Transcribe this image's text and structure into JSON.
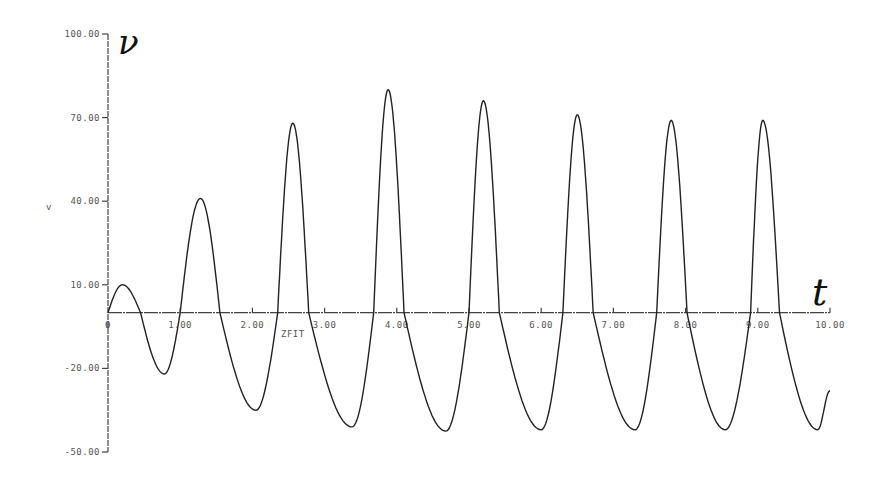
{
  "chart_data": {
    "type": "line",
    "title": "",
    "xlabel": "ZFIT",
    "ylabel": "v",
    "handwritten_y_label": "ν",
    "handwritten_x_label": "t",
    "xlim": [
      0,
      10
    ],
    "ylim": [
      -50,
      100
    ],
    "x_ticks": [
      0,
      1,
      2,
      3,
      4,
      5,
      6,
      7,
      8,
      9,
      10
    ],
    "x_tick_labels": [
      "0",
      "1.00",
      "2.00",
      "3.00",
      "4.00",
      "5.00",
      "6.00",
      "7.00",
      "8.00",
      "9.00",
      "10.00"
    ],
    "y_ticks": [
      100,
      70,
      40,
      10,
      -20,
      -50
    ],
    "y_tick_labels": [
      "100.00",
      "70.00",
      "40.00",
      "10.00",
      "-20.00",
      "-50.00"
    ],
    "grid": false,
    "legend": null,
    "series": [
      {
        "name": "v(t)",
        "color": "#222222",
        "points": [
          [
            0.0,
            0
          ],
          [
            0.2,
            10
          ],
          [
            0.45,
            0
          ],
          [
            0.78,
            -22
          ],
          [
            1.0,
            0
          ],
          [
            1.28,
            41
          ],
          [
            1.55,
            0
          ],
          [
            2.05,
            -35
          ],
          [
            2.35,
            0
          ],
          [
            2.56,
            68
          ],
          [
            2.78,
            0
          ],
          [
            3.38,
            -41
          ],
          [
            3.68,
            0
          ],
          [
            3.88,
            80
          ],
          [
            4.1,
            0
          ],
          [
            4.68,
            -42.5
          ],
          [
            5.0,
            0
          ],
          [
            5.2,
            76
          ],
          [
            5.42,
            0
          ],
          [
            6.0,
            -42
          ],
          [
            6.3,
            0
          ],
          [
            6.5,
            71
          ],
          [
            6.72,
            0
          ],
          [
            7.3,
            -42
          ],
          [
            7.6,
            0
          ],
          [
            7.8,
            69
          ],
          [
            8.02,
            0
          ],
          [
            8.55,
            -42
          ],
          [
            8.9,
            0
          ],
          [
            9.07,
            69
          ],
          [
            9.3,
            0
          ],
          [
            9.83,
            -42
          ],
          [
            10.0,
            -28
          ]
        ],
        "peaks": [
          {
            "t": 0.2,
            "v": 10
          },
          {
            "t": 1.28,
            "v": 41
          },
          {
            "t": 2.56,
            "v": 68
          },
          {
            "t": 3.88,
            "v": 80
          },
          {
            "t": 5.2,
            "v": 76
          },
          {
            "t": 6.5,
            "v": 71
          },
          {
            "t": 7.8,
            "v": 69
          },
          {
            "t": 9.07,
            "v": 69
          }
        ],
        "troughs": [
          {
            "t": 0.78,
            "v": -22
          },
          {
            "t": 2.05,
            "v": -35
          },
          {
            "t": 3.38,
            "v": -41
          },
          {
            "t": 4.68,
            "v": -42.5
          },
          {
            "t": 6.0,
            "v": -42
          },
          {
            "t": 7.3,
            "v": -42
          },
          {
            "t": 8.55,
            "v": -42
          },
          {
            "t": 9.83,
            "v": -42
          }
        ]
      }
    ]
  },
  "layout": {
    "plot_x0": 108,
    "plot_x1": 830,
    "plot_y_top": 34,
    "plot_y_bottom": 452
  }
}
